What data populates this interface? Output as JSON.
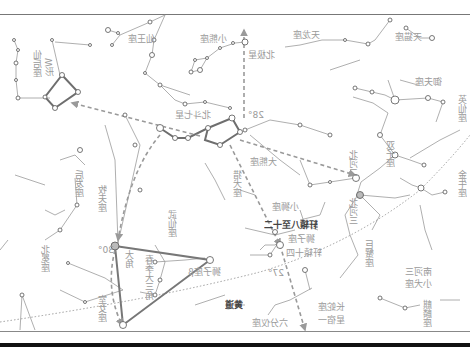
{
  "diagram": {
    "type": "star-chart",
    "mirrored": true,
    "colors": {
      "background": "#ffffff",
      "constellation_line": "#9a9a9a",
      "asterism_line": "#6e6e6e",
      "pointer_arrow": "#9a9a9a",
      "ecliptic": "#888888",
      "star_outline": "#555555",
      "label": "#9a9a9a"
    },
    "labels": {
      "cassiopeia_a": "仙后座",
      "cassiopeia_b": "W形",
      "cepheus": "仙王座",
      "ursa_minor": "小熊座",
      "polaris": "北极星",
      "draco": "天龙座",
      "big_dipper": "北斗七星",
      "ursa_major": "大熊座",
      "canes_venatici": "猎犬座",
      "lynx": "天猫座",
      "auriga": "御夫座",
      "perseus": "英仙座",
      "taurus": "金牛座",
      "gemini": "双子座",
      "pollux": "北河三",
      "castor": "北河二",
      "leo_minor": "小狮座",
      "leo": "狮子座",
      "regulus": "轩辕十四",
      "xuanyuan": "轩辕八至十二",
      "denebola": "狮子座β",
      "cancer": "巨蟹座",
      "canis_minor": "小犬座",
      "procyon": "南河三",
      "hydra": "长蛇座",
      "alphard": "星宿一",
      "sextans": "六分仪座",
      "ecliptic": "黄道",
      "bootes": "牧夫座",
      "arcturus": "大角",
      "spring_triangle": "春季大三角",
      "virgo": "室女座",
      "coma": "后发座",
      "corona": "北冕座",
      "hercules": "武仙座",
      "monoceros": "麒麟座",
      "orion": "猎户座",
      "canis_major": "天狼星",
      "angle_30": "30°",
      "angle_27": "27°",
      "angle_28": "28°"
    }
  }
}
